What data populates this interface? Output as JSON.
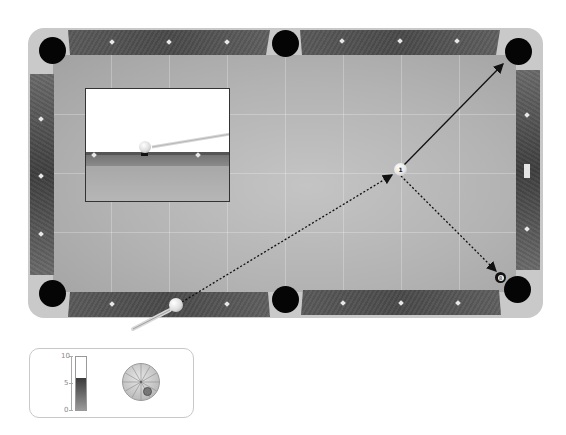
{
  "game": {
    "type": "pool-table",
    "colors": {
      "felt": "#b5b5b5",
      "rail": "#505050",
      "frame": "#c9c9c9",
      "pocket": "#050505",
      "aim_line": "#111111"
    }
  },
  "balls": {
    "cue": {
      "label": "",
      "x": 176,
      "y": 305
    },
    "object": {
      "label": "1",
      "x": 400,
      "y": 170
    },
    "eight": {
      "label": "8",
      "x": 501,
      "y": 278
    }
  },
  "aim": {
    "cue_to_object": "dotted",
    "object_to_pocket": "solid",
    "deflection_to_eight": "dotted"
  },
  "inset_view": {
    "label": "cue-perspective-view"
  },
  "power_meter": {
    "ticks": [
      "10",
      "5",
      "0"
    ],
    "value": 6,
    "max": 10
  },
  "spin_control": {
    "offset_x": 0.35,
    "offset_y": 0.5
  }
}
